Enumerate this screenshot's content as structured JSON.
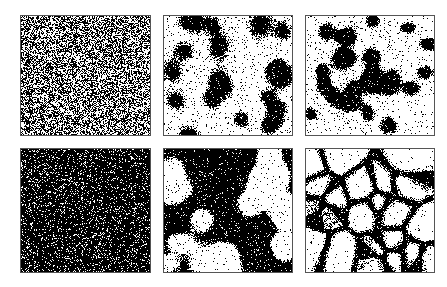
{
  "figure": {
    "layout": {
      "rows": 2,
      "cols": 3
    },
    "colors": {
      "background": "#ffffff",
      "ink": "#000000",
      "border": "#555555"
    },
    "panels": [
      {
        "id": "a",
        "row": 0,
        "col": 0,
        "x": 20,
        "y": 15,
        "w": 131,
        "h": 121,
        "pattern": "noise",
        "density": 0.5,
        "seed": 11
      },
      {
        "id": "b",
        "row": 0,
        "col": 1,
        "x": 163,
        "y": 15,
        "w": 130,
        "h": 121,
        "pattern": "spots",
        "invert": false,
        "blob_count": 22,
        "blob_radius": 10,
        "softness": 0.55,
        "seed": 23
      },
      {
        "id": "c",
        "row": 0,
        "col": 2,
        "x": 305,
        "y": 15,
        "w": 130,
        "h": 121,
        "pattern": "spots",
        "invert": false,
        "blob_count": 24,
        "blob_radius": 9,
        "softness": 0.35,
        "seed": 37
      },
      {
        "id": "d",
        "row": 1,
        "col": 0,
        "x": 20,
        "y": 148,
        "w": 131,
        "h": 125,
        "pattern": "noise",
        "density": 0.86,
        "seed": 41
      },
      {
        "id": "e",
        "row": 1,
        "col": 1,
        "x": 163,
        "y": 148,
        "w": 130,
        "h": 125,
        "pattern": "spots",
        "invert": true,
        "blob_count": 20,
        "blob_radius": 13,
        "softness": 0.25,
        "seed": 53
      },
      {
        "id": "f",
        "row": 1,
        "col": 2,
        "x": 305,
        "y": 148,
        "w": 130,
        "h": 125,
        "pattern": "cells",
        "cell_count": 22,
        "wall": 4.5,
        "seed": 67
      }
    ]
  }
}
